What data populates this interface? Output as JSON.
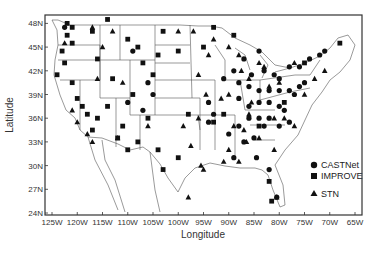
{
  "map": {
    "xlabel": "Longitude",
    "ylabel": "Latitude",
    "x_ticks": [
      "125W",
      "120W",
      "115W",
      "110W",
      "105W",
      "100W",
      "95W",
      "90W",
      "85W",
      "80W",
      "75W",
      "70W",
      "65W"
    ],
    "y_ticks": [
      "24N",
      "27N",
      "30N",
      "33N",
      "36N",
      "39N",
      "42N",
      "45N",
      "48N"
    ],
    "legend": [
      {
        "label": "CASTNet",
        "marker": "circle"
      },
      {
        "label": "IMPROVE",
        "marker": "square"
      },
      {
        "label": "STN",
        "marker": "triangle"
      }
    ],
    "marker_color": "#111111",
    "line_color": "#555555"
  },
  "chart_data": {
    "type": "scatter",
    "title": "",
    "xlabel": "Longitude",
    "ylabel": "Latitude",
    "xlim": [
      -126.5,
      -63.5
    ],
    "ylim": [
      24,
      49
    ],
    "series": [
      {
        "name": "CASTNet",
        "marker": "circle",
        "points": [
          [
            -122.5,
            47.5
          ],
          [
            -84,
            44.5
          ],
          [
            -87,
            43.5
          ],
          [
            -89,
            42
          ],
          [
            -85.5,
            41.5
          ],
          [
            -83,
            42
          ],
          [
            -81,
            41.5
          ],
          [
            -80,
            41
          ],
          [
            -78,
            42.5
          ],
          [
            -76,
            42.5
          ],
          [
            -74,
            43.5
          ],
          [
            -72,
            44
          ],
          [
            -71,
            44.5
          ],
          [
            -88,
            40.5
          ],
          [
            -86,
            40
          ],
          [
            -84,
            39.5
          ],
          [
            -82,
            39.5
          ],
          [
            -80,
            39.5
          ],
          [
            -78,
            39.5
          ],
          [
            -77,
            39
          ],
          [
            -76,
            40
          ],
          [
            -75,
            40.5
          ],
          [
            -84,
            38
          ],
          [
            -86,
            37.5
          ],
          [
            -82,
            38
          ],
          [
            -80,
            37.5
          ],
          [
            -79,
            37
          ],
          [
            -84,
            36
          ],
          [
            -82,
            36
          ],
          [
            -83,
            35
          ],
          [
            -86,
            36
          ],
          [
            -88,
            35
          ],
          [
            -90,
            34
          ],
          [
            -87,
            33
          ],
          [
            -85,
            33.5
          ],
          [
            -84.5,
            31
          ],
          [
            -80,
            35
          ],
          [
            -78,
            35.5
          ],
          [
            -94,
            38
          ],
          [
            -93,
            36.5
          ],
          [
            -105,
            39
          ],
          [
            -106,
            40.5
          ],
          [
            -110,
            38
          ],
          [
            -109,
            44.5
          ],
          [
            -107,
            37
          ],
          [
            -80.5,
            26
          ],
          [
            -82,
            29.5
          ],
          [
            -91,
            41
          ],
          [
            -88,
            38.5
          ],
          [
            -94,
            35.5
          ],
          [
            -89,
            31
          ]
        ]
      },
      {
        "name": "IMPROVE",
        "marker": "square",
        "points": [
          [
            -122,
            48
          ],
          [
            -121,
            47.5
          ],
          [
            -122,
            46.5
          ],
          [
            -121,
            45.5
          ],
          [
            -123,
            44.5
          ],
          [
            -122.5,
            43
          ],
          [
            -124,
            41.5
          ],
          [
            -121,
            40.5
          ],
          [
            -120,
            38.5
          ],
          [
            -119,
            37.5
          ],
          [
            -118,
            36.5
          ],
          [
            -117,
            34.5
          ],
          [
            -116,
            36
          ],
          [
            -114,
            37.5
          ],
          [
            -113,
            41
          ],
          [
            -116,
            43.5
          ],
          [
            -114,
            48.5
          ],
          [
            -110,
            46
          ],
          [
            -108,
            45
          ],
          [
            -107,
            43
          ],
          [
            -104,
            44
          ],
          [
            -103,
            47
          ],
          [
            -100,
            44.5
          ],
          [
            -112,
            33.5
          ],
          [
            -111,
            35
          ],
          [
            -110,
            32
          ],
          [
            -108,
            33
          ],
          [
            -106,
            36
          ],
          [
            -104,
            32
          ],
          [
            -103,
            29.5
          ],
          [
            -100,
            31
          ],
          [
            -98,
            36.5
          ],
          [
            -93,
            35.5
          ],
          [
            -91,
            36.5
          ],
          [
            -84,
            35
          ],
          [
            -79,
            38
          ],
          [
            -75,
            43
          ],
          [
            -68,
            45.5
          ],
          [
            -82,
            28
          ],
          [
            -81.5,
            25.5
          ],
          [
            -117,
            47
          ],
          [
            -109,
            39
          ],
          [
            -105,
            41.5
          ],
          [
            -95,
            45
          ],
          [
            -93,
            47.5
          ],
          [
            -89,
            46.5
          ]
        ]
      },
      {
        "name": "STN",
        "marker": "triangle",
        "points": [
          [
            -122.5,
            45.5
          ],
          [
            -117,
            47.5
          ],
          [
            -115,
            45
          ],
          [
            -113,
            47
          ],
          [
            -116,
            41
          ],
          [
            -118,
            34
          ],
          [
            -117,
            33
          ],
          [
            -121,
            37
          ],
          [
            -120,
            35.5
          ],
          [
            -112,
            33.5
          ],
          [
            -111,
            40.5
          ],
          [
            -106,
            35
          ],
          [
            -99,
            35
          ],
          [
            -96,
            36
          ],
          [
            -97.5,
            32.5
          ],
          [
            -95.5,
            30
          ],
          [
            -95,
            29.5
          ],
          [
            -98,
            26
          ],
          [
            -94,
            44
          ],
          [
            -93,
            46
          ],
          [
            -90,
            45
          ],
          [
            -88,
            44
          ],
          [
            -87.5,
            42
          ],
          [
            -90,
            39
          ],
          [
            -86,
            41
          ],
          [
            -84,
            43
          ],
          [
            -83,
            42.5
          ],
          [
            -81,
            36
          ],
          [
            -79,
            36
          ],
          [
            -77,
            35
          ],
          [
            -75,
            39
          ],
          [
            -73,
            41
          ],
          [
            -71,
            42
          ],
          [
            -77,
            43
          ],
          [
            -80,
            40.5
          ],
          [
            -82,
            40
          ],
          [
            -85.5,
            38
          ],
          [
            -86,
            36.5
          ],
          [
            -87,
            34.5
          ],
          [
            -86.5,
            33
          ],
          [
            -89,
            35
          ],
          [
            -90,
            32
          ],
          [
            -91,
            30.5
          ],
          [
            -88,
            30.5
          ],
          [
            -84,
            33.5
          ],
          [
            -81,
            32
          ],
          [
            -80.5,
            26
          ],
          [
            -97,
            47
          ],
          [
            -100,
            47
          ],
          [
            -96,
            41.5
          ],
          [
            -94.5,
            39
          ],
          [
            -91.5,
            38.5
          ]
        ]
      }
    ]
  }
}
